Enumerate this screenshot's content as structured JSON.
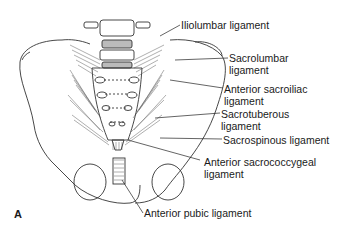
{
  "figure": {
    "panel_label": "A"
  },
  "labels": [
    {
      "id": "iliolumbar",
      "line1": "Iliolumbar ligament",
      "line2": ""
    },
    {
      "id": "sacrolumbar",
      "line1": "Sacrolumbar",
      "line2": "ligament"
    },
    {
      "id": "anterior-sacroiliac",
      "line1": "Anterior sacroiliac",
      "line2": "ligament"
    },
    {
      "id": "sacrotuberous",
      "line1": "Sacrotuberous",
      "line2": "ligament"
    },
    {
      "id": "sacrospinous",
      "line1": "Sacrospinous ligament",
      "line2": ""
    },
    {
      "id": "anterior-sacrococcygeal",
      "line1": "Anterior sacrococcygeal",
      "line2": "ligament"
    },
    {
      "id": "anterior-pubic",
      "line1": "Anterior pubic ligament",
      "line2": ""
    }
  ]
}
